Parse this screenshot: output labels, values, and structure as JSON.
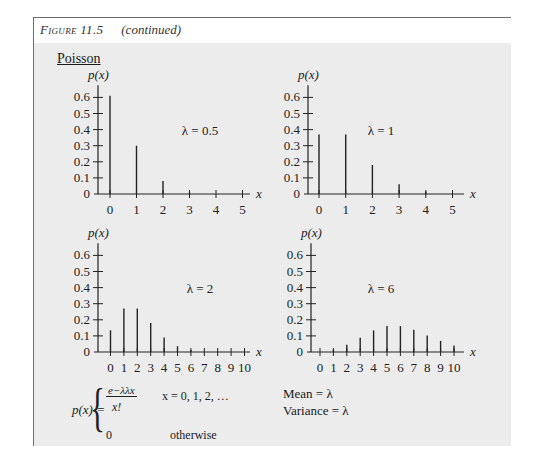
{
  "header": {
    "figure_label": "Figure 11.5",
    "continued": "(continued)"
  },
  "section_title": "Poisson",
  "chart_data": [
    {
      "type": "bar",
      "title": "λ = 0.5",
      "xlabel": "x",
      "ylabel": "p(x)",
      "categories": [
        "0",
        "1",
        "2",
        "3",
        "4",
        "5"
      ],
      "values": [
        0.61,
        0.3,
        0.08,
        0.01,
        0.002,
        0.0002
      ],
      "yticks": [
        "0",
        "0.1",
        "0.2",
        "0.3",
        "0.4",
        "0.5",
        "0.6"
      ],
      "ylim": [
        0,
        0.65
      ]
    },
    {
      "type": "bar",
      "title": "λ = 1",
      "xlabel": "x",
      "ylabel": "p(x)",
      "categories": [
        "0",
        "1",
        "2",
        "3",
        "4",
        "5"
      ],
      "values": [
        0.37,
        0.37,
        0.18,
        0.06,
        0.015,
        0.003
      ],
      "yticks": [
        "0",
        "0.1",
        "0.2",
        "0.3",
        "0.4",
        "0.5",
        "0.6"
      ],
      "ylim": [
        0,
        0.65
      ]
    },
    {
      "type": "bar",
      "title": "λ = 2",
      "xlabel": "x",
      "ylabel": "p(x)",
      "categories": [
        "0",
        "1",
        "2",
        "3",
        "4",
        "5",
        "6",
        "7",
        "8",
        "9",
        "10"
      ],
      "values": [
        0.135,
        0.27,
        0.27,
        0.18,
        0.09,
        0.036,
        0.012,
        0.003,
        0.001,
        0.0002,
        4e-05
      ],
      "yticks": [
        "0",
        "0.1",
        "0.2",
        "0.3",
        "0.4",
        "0.5",
        "0.6"
      ],
      "ylim": [
        0,
        0.65
      ]
    },
    {
      "type": "bar",
      "title": "λ = 6",
      "xlabel": "x",
      "ylabel": "p(x)",
      "categories": [
        "0",
        "1",
        "2",
        "3",
        "4",
        "5",
        "6",
        "7",
        "8",
        "9",
        "10"
      ],
      "values": [
        0.0025,
        0.015,
        0.045,
        0.089,
        0.134,
        0.161,
        0.161,
        0.138,
        0.103,
        0.069,
        0.041
      ],
      "yticks": [
        "0",
        "0.1",
        "0.2",
        "0.3",
        "0.4",
        "0.5",
        "0.6"
      ],
      "ylim": [
        0,
        0.65
      ]
    }
  ],
  "formula": {
    "lhs": "p(x) =",
    "case1_numerator": "e−λλx",
    "case1_denominator": "x!",
    "case1_condition": "x = 0, 1, 2, …",
    "case2_value": "0",
    "case2_condition": "otherwise"
  },
  "stats": {
    "mean": "Mean = λ",
    "variance": "Variance = λ"
  }
}
